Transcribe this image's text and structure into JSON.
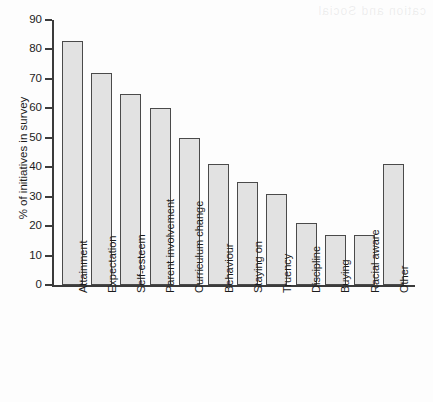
{
  "chart_data": {
    "type": "bar",
    "title": "",
    "xlabel": "",
    "ylabel": "% of initiatives in survey",
    "ylim": [
      0,
      90
    ],
    "ytick_step": 10,
    "yticks": [
      0,
      10,
      20,
      30,
      40,
      50,
      60,
      70,
      80,
      90
    ],
    "grid": false,
    "legend": "none",
    "orientation": "vertical",
    "xtick_label_rotation": -90,
    "bar_fill_color": "#e2e2e2",
    "bar_edge_color": "#4a4a4a",
    "axis_color": "#3b3b3b",
    "background_color": "#fdfdfd",
    "categories": [
      "Attainment",
      "Expectation",
      "Self-esteem",
      "Parent involvement",
      "Curriculum change",
      "Behaviour",
      "Staying on",
      "Truency",
      "Discipline",
      "Buying",
      "Racial aware",
      "Other"
    ],
    "values": [
      83,
      72,
      65,
      60,
      50,
      41,
      35,
      31,
      21,
      17,
      17,
      41
    ]
  },
  "artifact": {
    "bleed_text": "cation and Social"
  }
}
